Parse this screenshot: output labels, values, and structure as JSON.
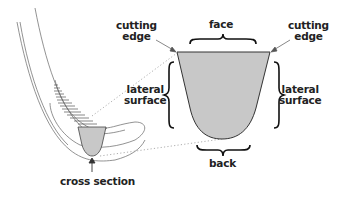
{
  "diagram": {
    "type": "cross-section illustration",
    "labels": {
      "cutting_edge_left_line1": "cutting",
      "cutting_edge_left_line2": "edge",
      "cutting_edge_right_line1": "cutting",
      "cutting_edge_right_line2": "edge",
      "face": "face",
      "lateral_left_line1": "lateral",
      "lateral_left_line2": "surface",
      "lateral_right_line1": "lateral",
      "lateral_right_line2": "surface",
      "back": "back",
      "cross_section": "cross section"
    },
    "colors": {
      "fill": "#c8c8c8",
      "stroke": "#333333",
      "text": "#222222",
      "dotted": "#999999"
    }
  }
}
